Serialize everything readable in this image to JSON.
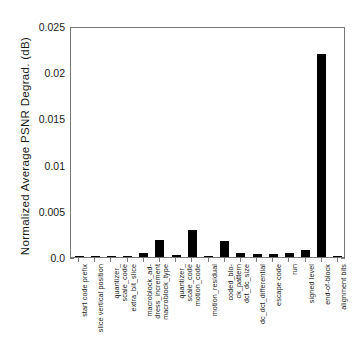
{
  "chart_data": {
    "type": "bar",
    "title": "",
    "subtitle": "",
    "xlabel": "",
    "ylabel": "Normalized Average PSNR Degrad. (dB)",
    "ylim": [
      0.0,
      0.025
    ],
    "yticks": [
      "0.0",
      "0.005",
      "0.01",
      "0.015",
      "0.02",
      "0.025"
    ],
    "ytick_values": [
      0.0,
      0.005,
      0.01,
      0.015,
      0.02,
      0.025
    ],
    "grid": false,
    "legend": null,
    "bar_color": "#000000",
    "categories": [
      "start code prefix",
      "slice vertical position",
      "quantizer_\nscale_code",
      "extra_bit_slice",
      "macroblock_ad-\ndress_increment",
      "macroblock_type",
      "quantizer_\nscale_code",
      "motion_code",
      "motion_residual",
      "coded_blo-\nck_pattern",
      "dct_dc_size",
      "dc_dct_differential",
      "escape code",
      "run",
      "signed level",
      "end-of-block",
      "alignment bits"
    ],
    "values": [
      0.0001,
      5e-05,
      5e-05,
      5e-05,
      0.0004,
      0.0018,
      0.0002,
      0.0029,
      5e-05,
      0.0017,
      0.0004,
      0.0003,
      0.0003,
      0.0004,
      0.0008,
      0.022,
      5e-05
    ]
  }
}
